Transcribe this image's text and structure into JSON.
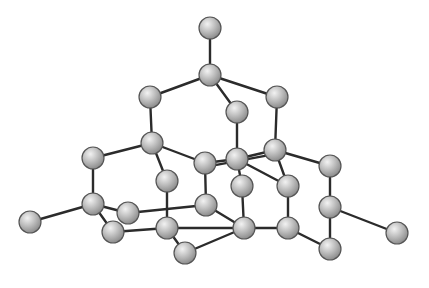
{
  "diagram": {
    "type": "ball-and-stick molecular model",
    "colors": {
      "atom_light": "#e6e6e6",
      "atom_mid": "#b4b4b4",
      "atom_dark": "#7a7a7a",
      "atom_stroke": "#555555",
      "bond": "#2b2b2b",
      "background": "#ffffff"
    },
    "atom_radius": 11,
    "atoms": [
      {
        "id": "a1",
        "x": 210,
        "y": 28
      },
      {
        "id": "a2",
        "x": 210,
        "y": 75
      },
      {
        "id": "a3",
        "x": 150,
        "y": 97
      },
      {
        "id": "a4",
        "x": 237,
        "y": 112
      },
      {
        "id": "a5",
        "x": 277,
        "y": 97
      },
      {
        "id": "a6",
        "x": 152,
        "y": 143
      },
      {
        "id": "a7",
        "x": 275,
        "y": 150
      },
      {
        "id": "a8",
        "x": 237,
        "y": 159
      },
      {
        "id": "a9",
        "x": 205,
        "y": 163
      },
      {
        "id": "a10",
        "x": 93,
        "y": 158
      },
      {
        "id": "a11",
        "x": 330,
        "y": 166
      },
      {
        "id": "a12",
        "x": 167,
        "y": 181
      },
      {
        "id": "a13",
        "x": 242,
        "y": 186
      },
      {
        "id": "a14",
        "x": 288,
        "y": 186
      },
      {
        "id": "a15",
        "x": 93,
        "y": 204
      },
      {
        "id": "a16",
        "x": 206,
        "y": 205
      },
      {
        "id": "a17",
        "x": 128,
        "y": 213
      },
      {
        "id": "a18",
        "x": 330,
        "y": 207
      },
      {
        "id": "a19",
        "x": 30,
        "y": 222
      },
      {
        "id": "a20",
        "x": 397,
        "y": 233
      },
      {
        "id": "a21",
        "x": 113,
        "y": 232
      },
      {
        "id": "a22",
        "x": 167,
        "y": 228
      },
      {
        "id": "a23",
        "x": 244,
        "y": 228
      },
      {
        "id": "a24",
        "x": 288,
        "y": 228
      },
      {
        "id": "a25",
        "x": 185,
        "y": 253
      },
      {
        "id": "a26",
        "x": 330,
        "y": 249
      }
    ],
    "bonds": [
      [
        "a1",
        "a2"
      ],
      [
        "a2",
        "a3"
      ],
      [
        "a2",
        "a4"
      ],
      [
        "a2",
        "a5"
      ],
      [
        "a3",
        "a6"
      ],
      [
        "a4",
        "a8"
      ],
      [
        "a5",
        "a7"
      ],
      [
        "a6",
        "a10"
      ],
      [
        "a6",
        "a9"
      ],
      [
        "a6",
        "a12"
      ],
      [
        "a9",
        "a8"
      ],
      [
        "a9",
        "a16"
      ],
      [
        "a8",
        "a7"
      ],
      [
        "a8",
        "a13"
      ],
      [
        "a8",
        "a14"
      ],
      [
        "a7",
        "a14"
      ],
      [
        "a7",
        "a11"
      ],
      [
        "a12",
        "a22"
      ],
      [
        "a10",
        "a15"
      ],
      [
        "a15",
        "a19"
      ],
      [
        "a15",
        "a17"
      ],
      [
        "a15",
        "a21"
      ],
      [
        "a17",
        "a16"
      ],
      [
        "a16",
        "a23"
      ],
      [
        "a13",
        "a23"
      ],
      [
        "a14",
        "a24"
      ],
      [
        "a21",
        "a22"
      ],
      [
        "a22",
        "a23"
      ],
      [
        "a22",
        "a25"
      ],
      [
        "a25",
        "a23"
      ],
      [
        "a23",
        "a24"
      ],
      [
        "a24",
        "a26"
      ],
      [
        "a11",
        "a18"
      ],
      [
        "a18",
        "a26"
      ],
      [
        "a18",
        "a20"
      ]
    ],
    "double_bond_offsets": [
      [
        "a9",
        "a7"
      ]
    ]
  }
}
